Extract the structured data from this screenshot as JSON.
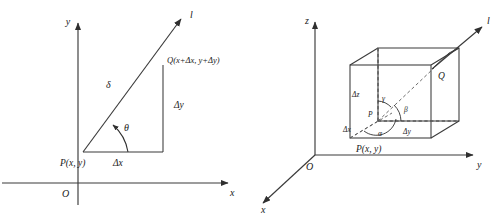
{
  "figure": {
    "name": "directional-derivative-diagrams",
    "panels": [
      {
        "id": "two-dimensional",
        "axes": {
          "x_label": "x",
          "y_label": "y",
          "origin_label": "O"
        },
        "ray_label": "l",
        "points": {
          "start_label": "P(x, y)",
          "end_label": "Q(x+Δx, y+Δy)"
        },
        "segments": {
          "hypotenuse_label": "δ",
          "horizontal_label": "Δx",
          "vertical_label": "Δy"
        },
        "angles": {
          "theta_label": "θ"
        }
      },
      {
        "id": "three-dimensional",
        "axes": {
          "x_label": "x",
          "y_label": "y",
          "z_label": "z",
          "origin_label": "O"
        },
        "ray_label": "l",
        "points": {
          "start_label": "P",
          "start_coord_label": "P(x, y)",
          "end_label": "Q"
        },
        "segments": {
          "dx_label": "Δx",
          "dy_label": "Δy",
          "dz_label": "Δz"
        },
        "angles": {
          "alpha_label": "α",
          "beta_label": "β",
          "gamma_label": "γ"
        }
      }
    ]
  },
  "style": {
    "line_color": "#3a3a3a",
    "dashed_color": "#5a5a5a",
    "text_color": "#1a1a1a",
    "background": "#ffffff"
  }
}
